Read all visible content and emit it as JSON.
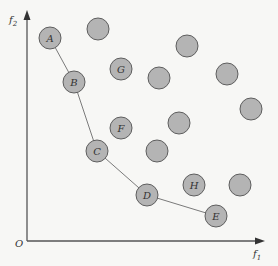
{
  "diagram": {
    "type": "pareto-front-scatter",
    "axes": {
      "origin_label": "O",
      "x_label": "f",
      "x_label_sub": "1",
      "y_label": "f",
      "y_label_sub": "2"
    },
    "colors": {
      "point_fill": "#b4b4b4",
      "point_stroke": "#5e5e5e",
      "front_line": "#7a7a7a",
      "axis": "#555555",
      "background": "#f7f7f5"
    },
    "pareto_front": [
      "A",
      "B",
      "C",
      "D",
      "E"
    ],
    "labeled_points": [
      {
        "label": "A",
        "x": 50,
        "y": 38,
        "on_front": true
      },
      {
        "label": "B",
        "x": 74,
        "y": 82,
        "on_front": true
      },
      {
        "label": "C",
        "x": 97,
        "y": 151,
        "on_front": true
      },
      {
        "label": "D",
        "x": 147,
        "y": 195,
        "on_front": true
      },
      {
        "label": "E",
        "x": 216,
        "y": 216,
        "on_front": true
      },
      {
        "label": "G",
        "x": 121,
        "y": 69,
        "on_front": false
      },
      {
        "label": "F",
        "x": 121,
        "y": 128,
        "on_front": false
      },
      {
        "label": "H",
        "x": 194,
        "y": 185,
        "on_front": false
      }
    ],
    "unlabeled_points": [
      {
        "x": 98,
        "y": 29
      },
      {
        "x": 187,
        "y": 46
      },
      {
        "x": 159,
        "y": 78
      },
      {
        "x": 227,
        "y": 74
      },
      {
        "x": 251,
        "y": 109
      },
      {
        "x": 179,
        "y": 123
      },
      {
        "x": 157,
        "y": 151
      },
      {
        "x": 240,
        "y": 185
      }
    ]
  }
}
